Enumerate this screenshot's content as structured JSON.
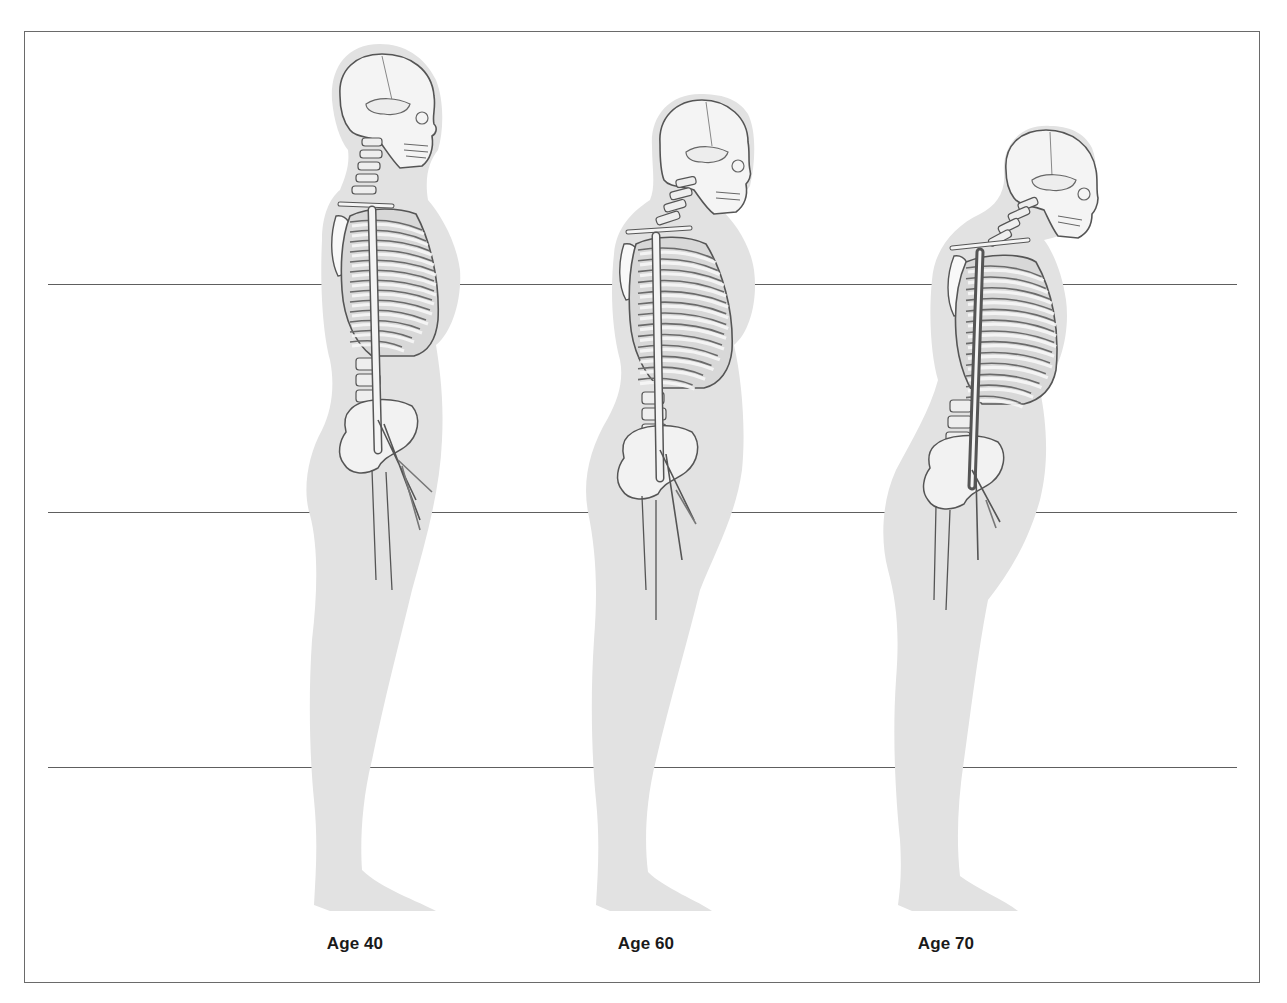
{
  "diagram": {
    "reference_lines_y": [
      284,
      512,
      767
    ],
    "colors": {
      "silhouette": "#e2e2e2",
      "bone_fill": "#f4f4f4",
      "bone_stroke": "#555555",
      "rib_dark": "#8a8a8a",
      "reference_line": "#5e5e5e",
      "frame": "#6a6a6a"
    },
    "figures": [
      {
        "id": "age-40",
        "label": "Age 40",
        "label_x": 355,
        "posture": "upright"
      },
      {
        "id": "age-60",
        "label": "Age 60",
        "label_x": 646,
        "posture": "moderate forward curve"
      },
      {
        "id": "age-70",
        "label": "Age 70",
        "label_x": 946,
        "posture": "pronounced forward curve"
      }
    ]
  }
}
